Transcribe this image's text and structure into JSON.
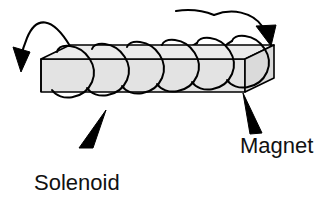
{
  "figure": {
    "type": "physics-diagram",
    "width": 336,
    "height": 200,
    "background_color": "#ffffff"
  },
  "labels": {
    "solenoid": {
      "text": "Solenoid",
      "font_size": 22,
      "color": "#111111",
      "x": 34,
      "y": 190
    },
    "magnet": {
      "text": "Magnet",
      "font_size": 22,
      "color": "#111111",
      "x": 240,
      "y": 153
    }
  },
  "magnet_bar": {
    "name": "bar-magnet",
    "fill_color": "#e3e3e3",
    "top_face_color": "#ebebeb",
    "end_face_color": "#d8d8d8",
    "stroke_color": "#000000",
    "stroke_width": 1.6
  },
  "coil": {
    "name": "solenoid-coil",
    "turns": 6,
    "stroke_color": "#000000",
    "stroke_width": 2.0,
    "current_direction": "right-to-left-over-top"
  },
  "arrows": {
    "left_lead": {
      "name": "left-current-arrow",
      "direction": "down-left",
      "color": "#000000"
    },
    "right_lead": {
      "name": "right-current-arrow",
      "direction": "down-right",
      "color": "#000000"
    }
  },
  "pointers": {
    "solenoid_pointer": {
      "name": "solenoid-leader-triangle",
      "color": "#000000",
      "points_toward": "coil-bottom-loop"
    },
    "magnet_pointer": {
      "name": "magnet-leader-triangle",
      "color": "#000000",
      "points_toward": "bar-magnet-right-end"
    }
  }
}
